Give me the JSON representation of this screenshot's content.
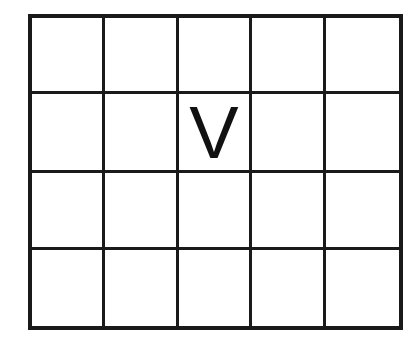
{
  "grid": {
    "rows": 4,
    "cols": 5,
    "line_color": "#1a1a1a",
    "background": "#ffffff",
    "cells": [
      [
        "",
        "",
        "",
        "",
        ""
      ],
      [
        "",
        "",
        "V",
        "",
        ""
      ],
      [
        "",
        "",
        "",
        "",
        ""
      ],
      [
        "",
        "",
        "",
        "",
        ""
      ]
    ]
  }
}
